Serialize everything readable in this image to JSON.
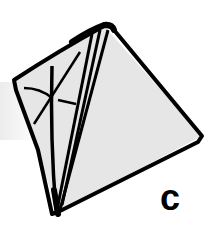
{
  "diagram": {
    "label": "c",
    "colors": {
      "face_fill": "#e6e6e6",
      "stroke": "#000000",
      "background": "#ffffff"
    }
  }
}
